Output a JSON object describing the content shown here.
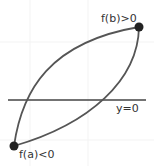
{
  "diagram": {
    "labels": {
      "fb": "f(b)>0",
      "fa": "f(a)<0",
      "axis": "y=0"
    },
    "points": {
      "a": {
        "x": 14,
        "y": 146
      },
      "b": {
        "x": 139,
        "y": 27
      }
    },
    "colors": {
      "curve": "#555555",
      "axis": "#444444",
      "point": "#222222",
      "text": "#333333",
      "background": "#ffffff"
    }
  }
}
